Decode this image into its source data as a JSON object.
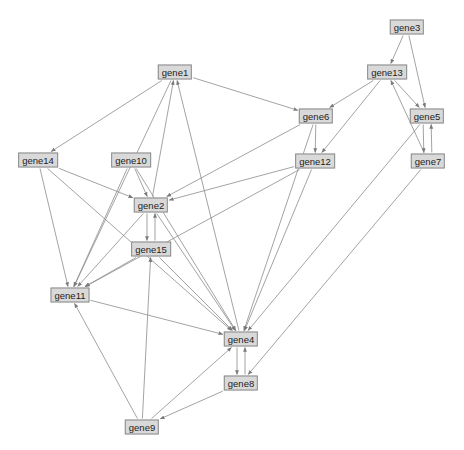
{
  "diagram": {
    "type": "directed-graph",
    "colors": {
      "background": "#ffffff",
      "node_fill": "#d9d9d9",
      "node_border": "#8a8a8a",
      "edge": "#8c8c8c",
      "label": "#222222"
    },
    "nodes": [
      {
        "id": "gene1",
        "label": "gene1",
        "x": 175,
        "y": 72
      },
      {
        "id": "gene3",
        "label": "gene3",
        "x": 407,
        "y": 27
      },
      {
        "id": "gene13",
        "label": "gene13",
        "x": 387,
        "y": 72
      },
      {
        "id": "gene6",
        "label": "gene6",
        "x": 316,
        "y": 116
      },
      {
        "id": "gene5",
        "label": "gene5",
        "x": 427,
        "y": 116
      },
      {
        "id": "gene12",
        "label": "gene12",
        "x": 315,
        "y": 161
      },
      {
        "id": "gene7",
        "label": "gene7",
        "x": 428,
        "y": 161
      },
      {
        "id": "gene14",
        "label": "gene14",
        "x": 38,
        "y": 160
      },
      {
        "id": "gene10",
        "label": "gene10",
        "x": 131,
        "y": 160
      },
      {
        "id": "gene2",
        "label": "gene2",
        "x": 151,
        "y": 205
      },
      {
        "id": "gene15",
        "label": "gene15",
        "x": 151,
        "y": 249
      },
      {
        "id": "gene11",
        "label": "gene11",
        "x": 70,
        "y": 295
      },
      {
        "id": "gene4",
        "label": "gene4",
        "x": 241,
        "y": 339
      },
      {
        "id": "gene8",
        "label": "gene8",
        "x": 241,
        "y": 383
      },
      {
        "id": "gene9",
        "label": "gene9",
        "x": 142,
        "y": 427
      }
    ],
    "edges": [
      {
        "from": "gene3",
        "to": "gene13"
      },
      {
        "from": "gene3",
        "to": "gene5"
      },
      {
        "from": "gene13",
        "to": "gene6"
      },
      {
        "from": "gene13",
        "to": "gene12"
      },
      {
        "from": "gene13",
        "to": "gene5"
      },
      {
        "from": "gene7",
        "to": "gene13"
      },
      {
        "from": "gene5",
        "to": "gene7"
      },
      {
        "from": "gene7",
        "to": "gene5"
      },
      {
        "from": "gene5",
        "to": "gene4"
      },
      {
        "from": "gene7",
        "to": "gene8"
      },
      {
        "from": "gene1",
        "to": "gene14"
      },
      {
        "from": "gene1",
        "to": "gene6"
      },
      {
        "from": "gene1",
        "to": "gene11"
      },
      {
        "from": "gene6",
        "to": "gene12"
      },
      {
        "from": "gene6",
        "to": "gene2"
      },
      {
        "from": "gene6",
        "to": "gene4"
      },
      {
        "from": "gene12",
        "to": "gene2"
      },
      {
        "from": "gene12",
        "to": "gene11"
      },
      {
        "from": "gene12",
        "to": "gene4"
      },
      {
        "from": "gene14",
        "to": "gene2"
      },
      {
        "from": "gene14",
        "to": "gene11"
      },
      {
        "from": "gene14",
        "to": "gene4"
      },
      {
        "from": "gene10",
        "to": "gene2"
      },
      {
        "from": "gene10",
        "to": "gene11"
      },
      {
        "from": "gene10",
        "to": "gene4"
      },
      {
        "from": "gene2",
        "to": "gene1"
      },
      {
        "from": "gene4",
        "to": "gene1"
      },
      {
        "from": "gene2",
        "to": "gene4"
      },
      {
        "from": "gene2",
        "to": "gene15"
      },
      {
        "from": "gene15",
        "to": "gene2"
      },
      {
        "from": "gene2",
        "to": "gene11"
      },
      {
        "from": "gene15",
        "to": "gene11"
      },
      {
        "from": "gene15",
        "to": "gene4"
      },
      {
        "from": "gene11",
        "to": "gene4"
      },
      {
        "from": "gene4",
        "to": "gene8"
      },
      {
        "from": "gene8",
        "to": "gene4"
      },
      {
        "from": "gene8",
        "to": "gene9"
      },
      {
        "from": "gene9",
        "to": "gene4"
      },
      {
        "from": "gene9",
        "to": "gene11"
      },
      {
        "from": "gene9",
        "to": "gene15"
      }
    ]
  }
}
